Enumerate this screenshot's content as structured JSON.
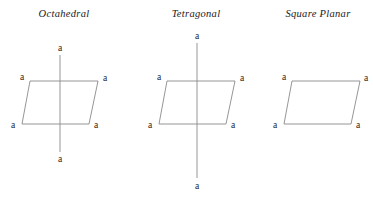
{
  "page": {
    "background_color": "#ffffff",
    "line_color": "#8a8a8a",
    "text_color": "#1f1d1c",
    "width": 373,
    "height": 197
  },
  "diagram": {
    "kind": "coordination-geometry-comparison",
    "ligand_symbol": "a",
    "figures": [
      {
        "id": "octahedral",
        "title": "Octahedral",
        "title_x": 64,
        "title_y": 15,
        "equatorial_plane": {
          "top_left": [
            30,
            81
          ],
          "top_right": [
            98,
            81
          ],
          "bottom_right": [
            89,
            124
          ],
          "bottom_left": [
            22,
            124
          ]
        },
        "axis": {
          "x": 60,
          "y_top": 55,
          "y_bottom": 152,
          "visible": true
        },
        "labels": [
          {
            "name": "axial-top",
            "text": "a",
            "x": 60,
            "y": 48
          },
          {
            "name": "equatorial-top-left",
            "text": "a",
            "x": 22,
            "y": 77
          },
          {
            "name": "equatorial-top-right",
            "text": "a",
            "x": 105,
            "y": 78
          },
          {
            "name": "equatorial-bottom-left",
            "text": "a",
            "x": 13,
            "y": 125
          },
          {
            "name": "equatorial-bottom-right",
            "text": "a",
            "x": 96,
            "y": 125
          },
          {
            "name": "axial-bottom",
            "text": "a",
            "x": 60,
            "y": 159
          }
        ]
      },
      {
        "id": "tetragonal",
        "title": "Tetragonal",
        "title_x": 196,
        "title_y": 15,
        "equatorial_plane": {
          "top_left": [
            167,
            81
          ],
          "top_right": [
            235,
            81
          ],
          "bottom_right": [
            226,
            124
          ],
          "bottom_left": [
            159,
            124
          ]
        },
        "axis": {
          "x": 197,
          "y_top": 43,
          "y_bottom": 178,
          "visible": true
        },
        "labels": [
          {
            "name": "axial-top",
            "text": "a",
            "x": 197,
            "y": 36
          },
          {
            "name": "equatorial-top-left",
            "text": "a",
            "x": 159,
            "y": 77
          },
          {
            "name": "equatorial-top-right",
            "text": "a",
            "x": 242,
            "y": 78
          },
          {
            "name": "equatorial-bottom-left",
            "text": "a",
            "x": 150,
            "y": 125
          },
          {
            "name": "equatorial-bottom-right",
            "text": "a",
            "x": 233,
            "y": 125
          },
          {
            "name": "axial-bottom",
            "text": "a",
            "x": 197,
            "y": 186
          }
        ]
      },
      {
        "id": "square-planar",
        "title": "Square Planar",
        "title_x": 318,
        "title_y": 15,
        "equatorial_plane": {
          "top_left": [
            292,
            81
          ],
          "top_right": [
            360,
            81
          ],
          "bottom_right": [
            351,
            124
          ],
          "bottom_left": [
            284,
            124
          ]
        },
        "axis": {
          "x": 322,
          "y_top": 0,
          "y_bottom": 0,
          "visible": false
        },
        "labels": [
          {
            "name": "equatorial-top-left",
            "text": "a",
            "x": 284,
            "y": 77
          },
          {
            "name": "equatorial-top-right",
            "text": "a",
            "x": 366,
            "y": 78
          },
          {
            "name": "equatorial-bottom-left",
            "text": "a",
            "x": 275,
            "y": 125
          },
          {
            "name": "equatorial-bottom-right",
            "text": "a",
            "x": 358,
            "y": 125
          }
        ]
      }
    ]
  }
}
